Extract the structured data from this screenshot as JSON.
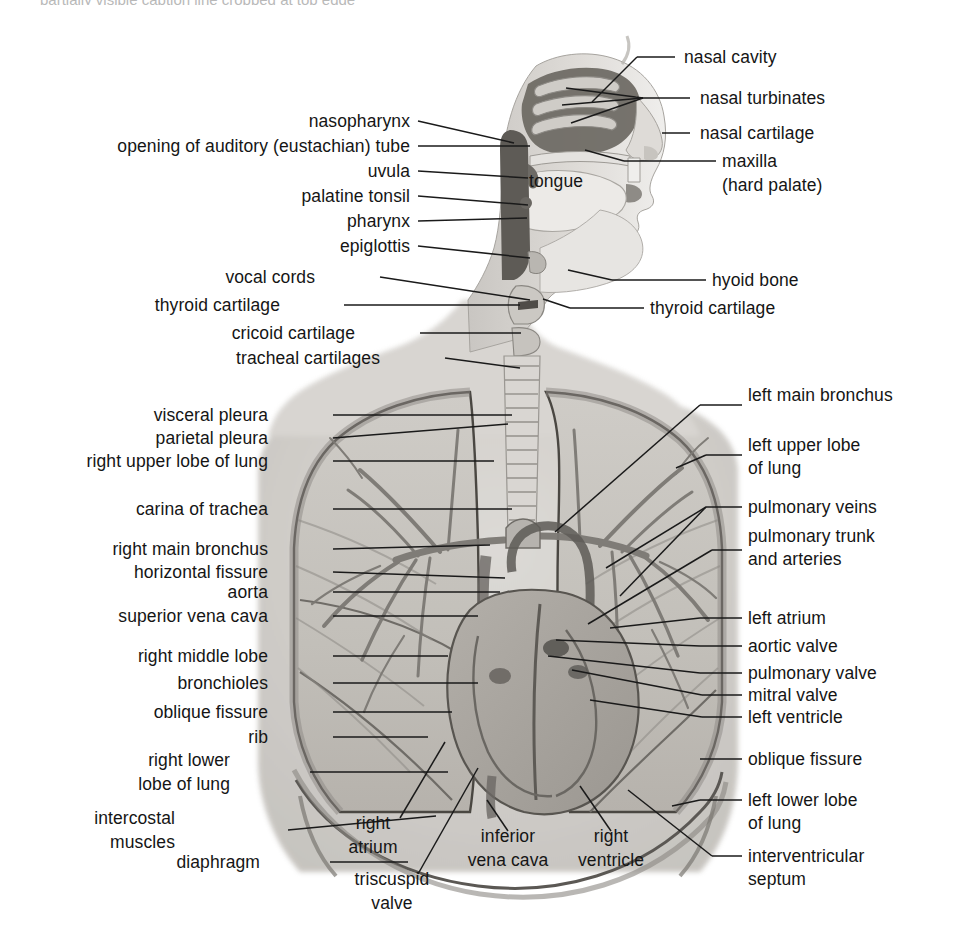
{
  "figure": {
    "style": "grayscale halftone medical illustration",
    "top_cut_caption": "partially visible caption line cropped at top edge",
    "colors": {
      "background": "#ffffff",
      "text": "#151515",
      "leader_line": "#1a1a1a",
      "tissue_light": "#d8d5d1",
      "tissue_mid": "#b4b0ab",
      "tissue_dark": "#7d7ا76",
      "cavity_dark": "#5d5a57",
      "lung_fill": "#c2bfba",
      "heart_fill": "#a9a5a0"
    }
  },
  "labels_head_left": [
    {
      "id": "nasopharynx",
      "text": "nasopharynx",
      "x": 410,
      "y": 126
    },
    {
      "id": "auditory-tube",
      "text": "opening of auditory (eustachian) tube",
      "x": 410,
      "y": 151
    },
    {
      "id": "uvula",
      "text": "uvula",
      "x": 410,
      "y": 176
    },
    {
      "id": "palatine-tonsil",
      "text": "palatine tonsil",
      "x": 410,
      "y": 201
    },
    {
      "id": "pharynx",
      "text": "pharynx",
      "x": 410,
      "y": 226
    },
    {
      "id": "epiglottis",
      "text": "epiglottis",
      "x": 410,
      "y": 251
    },
    {
      "id": "vocal-cords",
      "text": "vocal cords",
      "x": 315,
      "y": 282
    },
    {
      "id": "thyroid-cartilage-l",
      "text": "thyroid cartilage",
      "x": 280,
      "y": 310
    },
    {
      "id": "cricoid-cartilage",
      "text": "cricoid cartilage",
      "x": 355,
      "y": 338
    },
    {
      "id": "tracheal-cartilages",
      "text": "tracheal cartilages",
      "x": 380,
      "y": 363
    }
  ],
  "labels_head_right": [
    {
      "id": "nasal-cavity",
      "text": "nasal cavity",
      "x": 684,
      "y": 62
    },
    {
      "id": "nasal-turbinates",
      "text": "nasal turbinates",
      "x": 700,
      "y": 103
    },
    {
      "id": "nasal-cartilage",
      "text": "nasal cartilage",
      "x": 700,
      "y": 138
    },
    {
      "id": "maxilla",
      "text": "maxilla",
      "x": 722,
      "y": 166
    },
    {
      "id": "maxilla-sub",
      "text": "(hard palate)",
      "x": 722,
      "y": 190
    },
    {
      "id": "hyoid-bone",
      "text": "hyoid bone",
      "x": 712,
      "y": 285
    },
    {
      "id": "thyroid-cartilage-r",
      "text": "thyroid cartilage",
      "x": 650,
      "y": 313
    }
  ],
  "labels_inline": [
    {
      "id": "tongue",
      "text": "tongue",
      "x": 556,
      "y": 186
    }
  ],
  "labels_thorax_left": [
    {
      "id": "visceral-pleura",
      "text": "visceral pleura",
      "x": 268,
      "y": 420
    },
    {
      "id": "parietal-pleura",
      "text": "parietal pleura",
      "x": 268,
      "y": 443
    },
    {
      "id": "right-upper-lobe",
      "text": "right upper lobe of lung",
      "x": 268,
      "y": 466
    },
    {
      "id": "carina-of-trachea",
      "text": "carina of trachea",
      "x": 268,
      "y": 514
    },
    {
      "id": "right-main-bronchus",
      "text": "right main bronchus",
      "x": 268,
      "y": 554
    },
    {
      "id": "horizontal-fissure",
      "text": "horizontal fissure",
      "x": 268,
      "y": 577
    },
    {
      "id": "aorta",
      "text": "aorta",
      "x": 268,
      "y": 597
    },
    {
      "id": "superior-vena-cava",
      "text": "superior vena cava",
      "x": 268,
      "y": 621
    },
    {
      "id": "right-middle-lobe",
      "text": "right middle lobe",
      "x": 268,
      "y": 661
    },
    {
      "id": "bronchioles",
      "text": "bronchioles",
      "x": 268,
      "y": 688
    },
    {
      "id": "oblique-fissure-r",
      "text": "oblique fissure",
      "x": 268,
      "y": 717
    },
    {
      "id": "rib",
      "text": "rib",
      "x": 268,
      "y": 742
    },
    {
      "id": "right-lower-lobe-1",
      "text": "right lower",
      "x": 230,
      "y": 765
    },
    {
      "id": "right-lower-lobe-2",
      "text": "lobe of lung",
      "x": 230,
      "y": 789
    },
    {
      "id": "intercostal-1",
      "text": "intercostal",
      "x": 175,
      "y": 823
    },
    {
      "id": "intercostal-2",
      "text": "muscles",
      "x": 175,
      "y": 847
    },
    {
      "id": "diaphragm",
      "text": "diaphragm",
      "x": 260,
      "y": 867
    }
  ],
  "labels_thorax_right": [
    {
      "id": "left-main-bronchus",
      "text": "left main bronchus",
      "x": 748,
      "y": 400
    },
    {
      "id": "left-upper-lobe-1",
      "text": "left upper lobe",
      "x": 748,
      "y": 450
    },
    {
      "id": "left-upper-lobe-2",
      "text": "of lung",
      "x": 748,
      "y": 473
    },
    {
      "id": "pulmonary-veins",
      "text": "pulmonary veins",
      "x": 748,
      "y": 512
    },
    {
      "id": "pulmonary-trunk-1",
      "text": "pulmonary trunk",
      "x": 748,
      "y": 541
    },
    {
      "id": "pulmonary-trunk-2",
      "text": "and arteries",
      "x": 748,
      "y": 564
    },
    {
      "id": "left-atrium",
      "text": "left atrium",
      "x": 748,
      "y": 623
    },
    {
      "id": "aortic-valve",
      "text": "aortic valve",
      "x": 748,
      "y": 651
    },
    {
      "id": "pulmonary-valve",
      "text": "pulmonary valve",
      "x": 748,
      "y": 678
    },
    {
      "id": "mitral-valve",
      "text": "mitral valve",
      "x": 748,
      "y": 700
    },
    {
      "id": "left-ventricle",
      "text": "left ventricle",
      "x": 748,
      "y": 722
    },
    {
      "id": "oblique-fissure-l",
      "text": "oblique fissure",
      "x": 748,
      "y": 764
    },
    {
      "id": "left-lower-lobe-1",
      "text": "left lower lobe",
      "x": 748,
      "y": 805
    },
    {
      "id": "left-lower-lobe-2",
      "text": "of lung",
      "x": 748,
      "y": 828
    },
    {
      "id": "interventricular-1",
      "text": "interventricular",
      "x": 748,
      "y": 861
    },
    {
      "id": "interventricular-2",
      "text": "septum",
      "x": 748,
      "y": 884
    }
  ],
  "labels_bottom_center": [
    {
      "id": "right-atrium-1",
      "text": "right",
      "x": 373,
      "y": 828
    },
    {
      "id": "right-atrium-2",
      "text": "atrium",
      "x": 373,
      "y": 852
    },
    {
      "id": "triscuspid-1",
      "text": "triscuspid",
      "x": 392,
      "y": 884
    },
    {
      "id": "triscuspid-2",
      "text": "valve",
      "x": 392,
      "y": 908
    },
    {
      "id": "inferior-vena-1",
      "text": "inferior",
      "x": 508,
      "y": 841
    },
    {
      "id": "inferior-vena-2",
      "text": "vena cava",
      "x": 508,
      "y": 865
    },
    {
      "id": "right-ventricle-1",
      "text": "right",
      "x": 611,
      "y": 841
    },
    {
      "id": "right-ventricle-2",
      "text": "ventricle",
      "x": 611,
      "y": 865
    }
  ],
  "leader_lines": [
    {
      "id": "ll-nasal-cavity",
      "d": "M 637,57 L 675,57"
    },
    {
      "id": "ll-nasal-cavity-2",
      "d": "M 637,57 L 592,102"
    },
    {
      "id": "ll-turbinates-a",
      "d": "M 690,98 L 643,98"
    },
    {
      "id": "ll-turbinates-b",
      "d": "M 643,98 L 566,88"
    },
    {
      "id": "ll-turbinates-c",
      "d": "M 643,98 L 562,105"
    },
    {
      "id": "ll-turbinates-d",
      "d": "M 643,98 L 571,123"
    },
    {
      "id": "ll-nasal-cartilage",
      "d": "M 690,133 L 662,133"
    },
    {
      "id": "ll-maxilla",
      "d": "M 716,161 L 624,161"
    },
    {
      "id": "ll-maxilla-2",
      "d": "M 624,161 L 585,150"
    },
    {
      "id": "ll-hyoid",
      "d": "M 706,280 L 612,280"
    },
    {
      "id": "ll-hyoid-2",
      "d": "M 612,280 L 568,270"
    },
    {
      "id": "ll-thyroid-r",
      "d": "M 644,308 L 570,308"
    },
    {
      "id": "ll-thyroid-r2",
      "d": "M 570,308 L 543,299"
    },
    {
      "id": "ll-nasopharynx",
      "d": "M 418,121 L 514,143"
    },
    {
      "id": "ll-auditory",
      "d": "M 418,146 L 530,146"
    },
    {
      "id": "ll-uvula",
      "d": "M 418,171 L 528,178"
    },
    {
      "id": "ll-palatine",
      "d": "M 418,196 L 528,205"
    },
    {
      "id": "ll-pharynx",
      "d": "M 418,221 L 527,218"
    },
    {
      "id": "ll-epiglottis",
      "d": "M 418,246 L 530,258"
    },
    {
      "id": "ll-vocal",
      "d": "M 380,277 L 530,300"
    },
    {
      "id": "ll-thyroid-l",
      "d": "M 344,305 L 520,305"
    },
    {
      "id": "ll-cricoid",
      "d": "M 420,333 L 521,333"
    },
    {
      "id": "ll-tracheal",
      "d": "M 445,358 L 520,368"
    },
    {
      "id": "ll-visceral",
      "d": "M 333,415 L 512,415"
    },
    {
      "id": "ll-parietal",
      "d": "M 333,438 L 508,424"
    },
    {
      "id": "ll-rul",
      "d": "M 333,461 L 494,461"
    },
    {
      "id": "ll-carina",
      "d": "M 333,509 L 512,509"
    },
    {
      "id": "ll-rmb",
      "d": "M 333,549 L 490,545"
    },
    {
      "id": "ll-horizontal",
      "d": "M 333,572 L 505,578"
    },
    {
      "id": "ll-aorta",
      "d": "M 333,592 L 500,592"
    },
    {
      "id": "ll-svc",
      "d": "M 333,616 L 478,616"
    },
    {
      "id": "ll-rml",
      "d": "M 333,656 L 448,656"
    },
    {
      "id": "ll-bronchioles",
      "d": "M 333,683 L 478,683"
    },
    {
      "id": "ll-oblique-r",
      "d": "M 333,712 L 452,712"
    },
    {
      "id": "ll-rib",
      "d": "M 333,737 L 428,737"
    },
    {
      "id": "ll-rll",
      "d": "M 310,772 L 448,772"
    },
    {
      "id": "ll-intercostal",
      "d": "M 288,830 L 436,816"
    },
    {
      "id": "ll-diaphragm",
      "d": "M 330,862 L 408,862"
    },
    {
      "id": "ll-lmb",
      "d": "M 742,405 L 700,405"
    },
    {
      "id": "ll-lmb-2",
      "d": "M 700,405 L 555,532"
    },
    {
      "id": "ll-lul",
      "d": "M 742,455 L 706,455"
    },
    {
      "id": "ll-lul-2",
      "d": "M 706,455 L 676,468"
    },
    {
      "id": "ll-pv",
      "d": "M 742,507 L 706,507"
    },
    {
      "id": "ll-pv-2",
      "d": "M 706,507 L 606,568"
    },
    {
      "id": "ll-pv-3",
      "d": "M 706,507 L 620,596"
    },
    {
      "id": "ll-pt",
      "d": "M 742,550 L 712,550"
    },
    {
      "id": "ll-pt-2",
      "d": "M 712,550 L 588,624"
    },
    {
      "id": "ll-la",
      "d": "M 742,618 L 700,618"
    },
    {
      "id": "ll-la-2",
      "d": "M 700,618 L 610,628"
    },
    {
      "id": "ll-av",
      "d": "M 742,646 L 700,646"
    },
    {
      "id": "ll-av-2",
      "d": "M 700,646 L 556,640"
    },
    {
      "id": "ll-pvalve",
      "d": "M 742,673 L 700,673"
    },
    {
      "id": "ll-pvalve-2",
      "d": "M 700,673 L 548,656"
    },
    {
      "id": "ll-mv",
      "d": "M 742,695 L 702,695"
    },
    {
      "id": "ll-mv-2",
      "d": "M 702,695 L 572,670"
    },
    {
      "id": "ll-lv",
      "d": "M 742,717 L 702,717"
    },
    {
      "id": "ll-lv-2",
      "d": "M 702,717 L 590,700"
    },
    {
      "id": "ll-oblique-l",
      "d": "M 742,759 L 700,759"
    },
    {
      "id": "ll-lll",
      "d": "M 742,800 L 700,800"
    },
    {
      "id": "ll-lll-2",
      "d": "M 700,800 L 672,806"
    },
    {
      "id": "ll-ivs",
      "d": "M 742,856 L 712,856"
    },
    {
      "id": "ll-ivs-2",
      "d": "M 712,856 L 628,790"
    },
    {
      "id": "ll-right-atrium",
      "d": "M 400,818 L 445,742"
    },
    {
      "id": "ll-triscuspid",
      "d": "M 418,874 L 478,768"
    },
    {
      "id": "ll-ivc",
      "d": "M 508,831 L 487,800"
    },
    {
      "id": "ll-rv",
      "d": "M 611,831 L 580,786"
    }
  ]
}
